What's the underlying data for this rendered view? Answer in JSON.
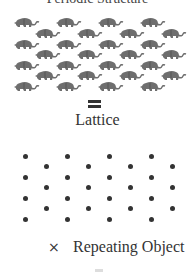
{
  "title_clipped": "Periodic Structure",
  "equals_symbol": "=",
  "lattice_label": "Lattice",
  "times_symbol": "×",
  "repeating_object_label": "Repeating Object",
  "colors": {
    "animal": "#6e6e6e",
    "dot": "#333333",
    "text": "#333333"
  },
  "animal_grid": {
    "main_rows_y": [
      15,
      37,
      58,
      79
    ],
    "main_cols_x": [
      14,
      56,
      98,
      140
    ],
    "offset_rows_y": [
      26,
      47,
      68
    ],
    "offset_cols_x": [
      35,
      77,
      119,
      161
    ]
  },
  "lattice_points": {
    "main_rows_y": [
      156,
      177,
      198,
      219
    ],
    "main_cols_x": [
      25,
      67,
      109,
      151
    ],
    "offset_rows_y": [
      166,
      187,
      208
    ],
    "offset_cols_x": [
      46,
      88,
      130,
      172
    ]
  }
}
